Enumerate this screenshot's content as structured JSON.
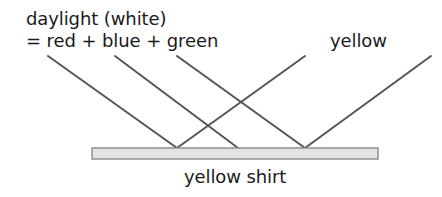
{
  "diagram": {
    "title_hidden": "",
    "labels": {
      "daylight_line1": "daylight (white)",
      "daylight_line2": "= red + blue + green",
      "yellow_ray": "yellow",
      "surface": "yellow shirt"
    },
    "colors": {
      "ray_stroke": "#555555",
      "surface_fill": "#e3e3e1",
      "surface_stroke": "#8a8a8a",
      "text": "#1a1a1a",
      "background": "#ffffff"
    },
    "surface": {
      "name": "yellow shirt",
      "x": 92,
      "y": 148,
      "width": 286,
      "height": 11
    },
    "incident_rays": [
      {
        "name": "incident-ray-1",
        "x1": 48,
        "y1": 56,
        "x2": 177,
        "y2": 148
      },
      {
        "name": "incident-ray-2",
        "x1": 115,
        "y1": 56,
        "x2": 238,
        "y2": 148
      },
      {
        "name": "incident-ray-3",
        "x1": 177,
        "y1": 56,
        "x2": 305,
        "y2": 148
      }
    ],
    "reflected_rays": [
      {
        "name": "reflected-ray-1",
        "x1": 177,
        "y1": 148,
        "x2": 305,
        "y2": 56
      },
      {
        "name": "reflected-ray-2",
        "x1": 305,
        "y1": 148,
        "x2": 431,
        "y2": 56
      }
    ],
    "contact_points": [
      {
        "name": "contact-point-1",
        "x": 177,
        "y": 148
      },
      {
        "name": "contact-point-2",
        "x": 238,
        "y": 148
      },
      {
        "name": "contact-point-3",
        "x": 305,
        "y": 148
      }
    ],
    "ray_stroke_width": 2
  }
}
